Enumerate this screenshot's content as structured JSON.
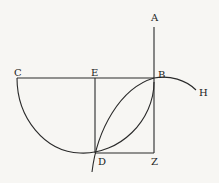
{
  "diagram": {
    "type": "geometric-construction",
    "stroke_color": "#2a2a2a",
    "background": "#f7f6f3",
    "labels": {
      "A": "A",
      "B": "B",
      "C": "C",
      "E": "E",
      "D": "D",
      "Z": "Z",
      "H": "H"
    },
    "points": {
      "A": [
        154,
        27
      ],
      "B": [
        154,
        78
      ],
      "C": [
        17,
        78
      ],
      "E": [
        95,
        78
      ],
      "D": [
        95,
        153
      ],
      "Z": [
        154,
        153
      ],
      "H": [
        198,
        93
      ]
    },
    "segments": [
      "AZ",
      "CB",
      "ED",
      "DZ"
    ],
    "curves": [
      "arc C-bottom-B",
      "curve below-D to B",
      "curve B to H"
    ]
  }
}
